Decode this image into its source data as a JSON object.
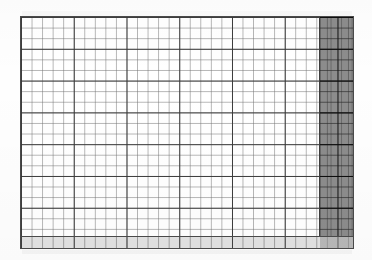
{
  "document": {
    "kind": "scanned-spreadsheet-grid",
    "title": "",
    "background_color": "#ffffff",
    "paper_color": "#fefefe"
  },
  "grid": {
    "x": 20,
    "y": 16,
    "width": 334,
    "height": 233,
    "columns": 32,
    "rows": 22,
    "cell_width": 10.55,
    "cell_height": 10.6,
    "major_column_interval": 5,
    "major_row_interval": 3,
    "border_color": "#4a4a4a",
    "minor_line_color": "#787878",
    "major_line_color": "#373737",
    "cell_fill_color": "#ffffff"
  },
  "shaded_block": {
    "label": "",
    "columns": 3,
    "width": 33,
    "position": "right",
    "fill_color": "#8c8c8c",
    "edge_color": "#3d3d3d"
  },
  "footer_strip": {
    "label": "",
    "height": 11,
    "fill_color": "#e2e2e2",
    "shaded_fill_color": "#969696",
    "border_color": "#4a4a4a"
  }
}
